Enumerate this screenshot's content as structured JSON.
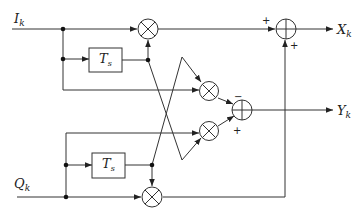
{
  "diagram": {
    "type": "block-diagram",
    "inputs": {
      "i": {
        "base": "I",
        "sub": "k"
      },
      "q": {
        "base": "Q",
        "sub": "k"
      }
    },
    "outputs": {
      "x": {
        "base": "X",
        "sub": "k"
      },
      "y": {
        "base": "Y",
        "sub": "k"
      }
    },
    "delay_blocks": [
      {
        "id": "delay-i",
        "base": "T",
        "sub": "s"
      },
      {
        "id": "delay-q",
        "base": "T",
        "sub": "s"
      }
    ],
    "multipliers": [
      "mult-top",
      "mult-mid-upper",
      "mult-mid-lower",
      "mult-bottom"
    ],
    "adders": [
      {
        "id": "sum-x",
        "signs": [
          "+",
          "+"
        ]
      },
      {
        "id": "sum-y",
        "signs": [
          "−",
          "+"
        ]
      }
    ],
    "stroke_color": "#333333"
  }
}
